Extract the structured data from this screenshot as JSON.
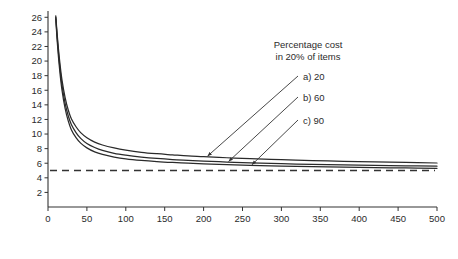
{
  "chart_data": {
    "type": "line",
    "title": "",
    "xlabel": "No. of items in estimate",
    "ylabel": "Mean error of estimates (%)",
    "xlim": [
      0,
      500
    ],
    "ylim": [
      0,
      27
    ],
    "xticks": [
      0,
      50,
      100,
      150,
      200,
      250,
      300,
      350,
      400,
      450,
      500
    ],
    "xtick_labels": [
      "0",
      "50",
      "100",
      "150",
      "200",
      "250",
      "300",
      "350",
      "400",
      "450",
      "500"
    ],
    "yticks": [
      2,
      4,
      6,
      8,
      10,
      12,
      14,
      16,
      18,
      20,
      22,
      24,
      26
    ],
    "ytick_labels": [
      "2",
      "4",
      "6",
      "8",
      "10",
      "12",
      "14",
      "16",
      "18",
      "20",
      "22",
      "24",
      "26"
    ],
    "grid": false,
    "legend_position": "upper-right-inside",
    "annotation_title_line1": "Percentage cost",
    "annotation_title_line2": "in 20% of items",
    "reference_line": {
      "value": 5,
      "style": "dashed",
      "color": "#333333",
      "label": ""
    },
    "series": [
      {
        "name": "a) 20",
        "label": "a)",
        "value": "20",
        "color": "#2a2a2a",
        "x": [
          10,
          12,
          15,
          18,
          22,
          26,
          30,
          36,
          42,
          50,
          60,
          70,
          85,
          100,
          120,
          140,
          160,
          180,
          200,
          230,
          260,
          300,
          340,
          380,
          420,
          460,
          500
        ],
        "y": [
          26.2,
          23.4,
          20.0,
          17.4,
          15.0,
          13.3,
          12.1,
          11.0,
          10.2,
          9.5,
          8.9,
          8.5,
          8.1,
          7.8,
          7.5,
          7.3,
          7.15,
          7.0,
          6.9,
          6.75,
          6.62,
          6.48,
          6.36,
          6.26,
          6.17,
          6.1,
          6.03
        ]
      },
      {
        "name": "b) 60",
        "label": "b)",
        "value": "60",
        "color": "#2a2a2a",
        "x": [
          10,
          12,
          15,
          18,
          22,
          26,
          30,
          36,
          42,
          50,
          60,
          70,
          85,
          100,
          120,
          140,
          160,
          180,
          200,
          230,
          260,
          300,
          340,
          380,
          420,
          460,
          500
        ],
        "y": [
          26.0,
          23.0,
          19.4,
          16.7,
          14.2,
          12.5,
          11.3,
          10.2,
          9.4,
          8.7,
          8.15,
          7.75,
          7.35,
          7.1,
          6.85,
          6.65,
          6.5,
          6.4,
          6.3,
          6.16,
          6.05,
          5.93,
          5.84,
          5.76,
          5.7,
          5.64,
          5.6
        ]
      },
      {
        "name": "c) 90",
        "label": "c)",
        "value": "90",
        "color": "#2a2a2a",
        "x": [
          10,
          12,
          15,
          18,
          22,
          26,
          30,
          36,
          42,
          50,
          60,
          70,
          85,
          100,
          120,
          140,
          160,
          180,
          200,
          230,
          260,
          300,
          340,
          380,
          420,
          460,
          500
        ],
        "y": [
          25.8,
          22.5,
          18.8,
          16.0,
          13.5,
          11.8,
          10.6,
          9.5,
          8.75,
          8.1,
          7.55,
          7.2,
          6.85,
          6.6,
          6.38,
          6.22,
          6.1,
          6.0,
          5.92,
          5.8,
          5.71,
          5.6,
          5.52,
          5.45,
          5.4,
          5.35,
          5.31
        ]
      }
    ],
    "annotations": [
      {
        "text": "a) 20",
        "points_to_series": 0
      },
      {
        "text": "b) 60",
        "points_to_series": 1
      },
      {
        "text": "c) 90",
        "points_to_series": 2
      }
    ]
  }
}
